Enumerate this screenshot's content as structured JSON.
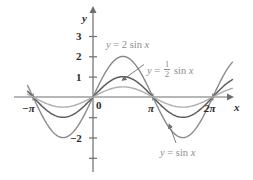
{
  "figure": {
    "background": "#ffffff",
    "axis_color": "#6e6e6e",
    "label_color": "#8e8e8e"
  },
  "axes": {
    "y_axis_name": "y",
    "x_axis_name": "x",
    "origin_label": "0",
    "y_ticks": [
      {
        "value": 3,
        "label": "3"
      },
      {
        "value": 2,
        "label": "2"
      },
      {
        "value": 1,
        "label": "1"
      },
      {
        "value": -2,
        "label": "−2"
      },
      {
        "value": -1,
        "label": ""
      },
      {
        "value": -3,
        "label": ""
      }
    ],
    "x_ticks": [
      {
        "value": -3.14159,
        "label": "−π"
      },
      {
        "value": 3.14159,
        "label": "π"
      },
      {
        "value": 6.28319,
        "label": "2π"
      }
    ],
    "xlim": [
      -3.45,
      6.75
    ],
    "ylim": [
      -3.5,
      3.5
    ],
    "grid": false
  },
  "annotations": [
    {
      "name": "label-2sinx",
      "text_parts": {
        "lhs": "y",
        "eq": "=",
        "coef": "2",
        "fn": "sin",
        "var": "x"
      },
      "full_text": "y = 2 sin x",
      "color": "#8e8e8e",
      "leader": false
    },
    {
      "name": "label-half-sinx",
      "text_parts": {
        "lhs": "y",
        "eq": "=",
        "num": "1",
        "den": "2",
        "fn": "sin",
        "var": "x"
      },
      "full_text": "y = 1/2 sin x",
      "color": "#8e8e8e",
      "leader": true
    },
    {
      "name": "label-sinx",
      "text_parts": {
        "lhs": "y",
        "eq": "=",
        "fn": "sin",
        "var": "x"
      },
      "full_text": "y = sin x",
      "color": "#8e8e8e",
      "leader": true
    }
  ],
  "chart_data": {
    "type": "line",
    "title": "",
    "xlabel": "x",
    "ylabel": "y",
    "xlim": [
      -3.45,
      6.75
    ],
    "ylim": [
      -3.5,
      3.5
    ],
    "grid": false,
    "legend": "inline-annotations",
    "x_tick_values": [
      -3.14159,
      3.14159,
      6.28319
    ],
    "x_tick_labels": [
      "−π",
      "π",
      "2π"
    ],
    "y_tick_values": [
      3,
      2,
      1,
      -1,
      -2,
      -3
    ],
    "y_tick_labels": [
      "3",
      "2",
      "1",
      "",
      "−2",
      ""
    ],
    "series": [
      {
        "name": "y = 2 sin x",
        "amplitude": 2,
        "function": "2*sin(x)",
        "color": "#8a8a8a",
        "width": 1.4,
        "key_points": [
          {
            "x": -3.14159,
            "y": 0
          },
          {
            "x": -1.5708,
            "y": -2
          },
          {
            "x": 0,
            "y": 0
          },
          {
            "x": 1.5708,
            "y": 2
          },
          {
            "x": 3.14159,
            "y": 0
          },
          {
            "x": 4.71239,
            "y": -2
          },
          {
            "x": 6.28319,
            "y": 0
          }
        ]
      },
      {
        "name": "y = sin x",
        "amplitude": 1,
        "function": "sin(x)",
        "color": "#5d5d5d",
        "width": 1.5,
        "key_points": [
          {
            "x": -3.14159,
            "y": 0
          },
          {
            "x": -1.5708,
            "y": -1
          },
          {
            "x": 0,
            "y": 0
          },
          {
            "x": 1.5708,
            "y": 1
          },
          {
            "x": 3.14159,
            "y": 0
          },
          {
            "x": 4.71239,
            "y": -1
          },
          {
            "x": 6.28319,
            "y": 0
          }
        ]
      },
      {
        "name": "y = 1/2 sin x",
        "amplitude": 0.5,
        "function": "0.5*sin(x)",
        "color": "#aeaeae",
        "width": 1.4,
        "key_points": [
          {
            "x": -3.14159,
            "y": 0
          },
          {
            "x": -1.5708,
            "y": -0.5
          },
          {
            "x": 0,
            "y": 0
          },
          {
            "x": 1.5708,
            "y": 0.5
          },
          {
            "x": 3.14159,
            "y": 0
          },
          {
            "x": 4.71239,
            "y": -0.5
          },
          {
            "x": 6.28319,
            "y": 0
          }
        ]
      }
    ]
  }
}
